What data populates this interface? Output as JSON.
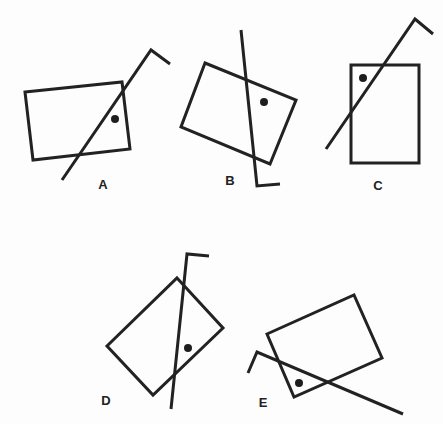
{
  "figures": [
    {
      "label": "A",
      "label_pos": [
        103,
        184
      ],
      "rect": [
        [
          25,
          92
        ],
        [
          122,
          82
        ],
        [
          130,
          149
        ],
        [
          33,
          160
        ]
      ],
      "line": [
        [
          62,
          180
        ],
        [
          151,
          50
        ],
        [
          170,
          64
        ]
      ],
      "dot": [
        115,
        119
      ]
    },
    {
      "label": "B",
      "label_pos": [
        230,
        180
      ],
      "rect": [
        [
          205,
          63
        ],
        [
          296,
          100
        ],
        [
          270,
          164
        ],
        [
          181,
          127
        ]
      ],
      "line": [
        [
          241,
          30
        ],
        [
          257,
          186
        ],
        [
          280,
          184
        ]
      ],
      "dot": [
        264,
        102
      ]
    },
    {
      "label": "C",
      "label_pos": [
        378,
        185
      ],
      "rect": [
        [
          351,
          65
        ],
        [
          419,
          65
        ],
        [
          419,
          163
        ],
        [
          351,
          163
        ]
      ],
      "line": [
        [
          326,
          149
        ],
        [
          415,
          19
        ],
        [
          433,
          34
        ]
      ],
      "dot": [
        363,
        78
      ]
    },
    {
      "label": "D",
      "label_pos": [
        106,
        400
      ],
      "rect": [
        [
          177,
          278
        ],
        [
          223,
          328
        ],
        [
          153,
          395
        ],
        [
          107,
          346
        ]
      ],
      "line": [
        [
          171,
          409
        ],
        [
          187,
          254
        ],
        [
          209,
          256
        ]
      ],
      "dot": [
        188,
        348
      ]
    },
    {
      "label": "E",
      "label_pos": [
        263,
        402
      ],
      "rect": [
        [
          267,
          334
        ],
        [
          354,
          295
        ],
        [
          382,
          358
        ],
        [
          294,
          397
        ]
      ],
      "line": [
        [
          403,
          414
        ],
        [
          257,
          352
        ],
        [
          248,
          373
        ]
      ],
      "dot": [
        299,
        383
      ]
    }
  ],
  "colors": {
    "stroke": "#222222",
    "dot": "#1e1e1e",
    "background": "#fdfdfd"
  }
}
